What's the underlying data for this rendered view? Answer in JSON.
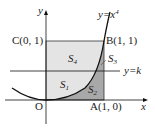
{
  "diagram": {
    "curve": {
      "equation": "y=x",
      "exponent": "4"
    },
    "line": {
      "equation": "y=k"
    },
    "points": {
      "O": {
        "label": "O"
      },
      "A": {
        "label": "A(1, 0)"
      },
      "B": {
        "label": "B(1, 1)"
      },
      "C": {
        "label": "C(0, 1)"
      }
    },
    "axes": {
      "x": "x",
      "y": "y"
    },
    "regions": [
      {
        "name": "S",
        "sub": "1"
      },
      {
        "name": "S",
        "sub": "2"
      },
      {
        "name": "S",
        "sub": "3"
      },
      {
        "name": "S",
        "sub": "4"
      }
    ],
    "colors": {
      "light_fill": "#e4e4e4",
      "dark_fill": "#a8a8a8",
      "line": "#111111"
    }
  }
}
